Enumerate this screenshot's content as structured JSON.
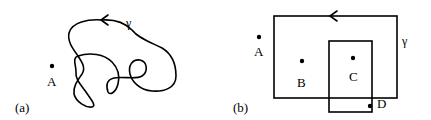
{
  "panel_a": {
    "label": "(a)",
    "curve_label": "γ",
    "points": [
      {
        "name": "A",
        "x": 52,
        "y": 66,
        "label_x": 48,
        "label_y": 85
      }
    ]
  },
  "panel_b": {
    "label": "(b)",
    "curve_label": "γ",
    "outer_rect": {
      "x": 274,
      "y": 16,
      "w": 123,
      "h": 82
    },
    "inner_rect": {
      "x": 329,
      "y": 41,
      "w": 43,
      "h": 71
    },
    "points": [
      {
        "name": "A",
        "x": 259,
        "y": 37,
        "label_x": 258,
        "label_y": 55
      },
      {
        "name": "B",
        "x": 302,
        "y": 61,
        "label_x": 301,
        "label_y": 86
      },
      {
        "name": "C",
        "x": 353,
        "y": 58,
        "label_x": 354,
        "label_y": 80
      },
      {
        "name": "D",
        "x": 370,
        "y": 106,
        "label_x": 383,
        "label_y": 107
      }
    ]
  },
  "colors": {
    "stroke": "#000000",
    "background": "#ffffff"
  }
}
